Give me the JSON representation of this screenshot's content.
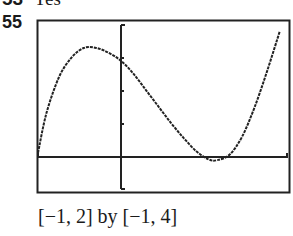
{
  "previous_item": {
    "number": "53",
    "text": "Yes"
  },
  "problem_number": "55",
  "caption": "[−1, 2] by [−1, 4]",
  "chart_data": {
    "type": "line",
    "title": "",
    "xlabel": "",
    "ylabel": "",
    "xlim": [
      -1,
      2
    ],
    "ylim": [
      -1,
      4
    ],
    "window_caption": "[−1, 2] by [−1, 4]",
    "grid": false,
    "x": [
      -1.0,
      -0.9,
      -0.75,
      -0.6,
      -0.45,
      -0.3,
      -0.15,
      0.0,
      0.15,
      0.3,
      0.45,
      0.6,
      0.75,
      0.9,
      1.05,
      1.15,
      1.3,
      1.45,
      1.6,
      1.75,
      1.9
    ],
    "y": [
      0.1,
      1.3,
      2.4,
      3.0,
      3.3,
      3.3,
      3.15,
      2.9,
      2.5,
      2.0,
      1.5,
      1.0,
      0.55,
      0.15,
      -0.1,
      -0.12,
      0.05,
      0.6,
      1.5,
      2.6,
      3.8
    ],
    "annotations": []
  }
}
